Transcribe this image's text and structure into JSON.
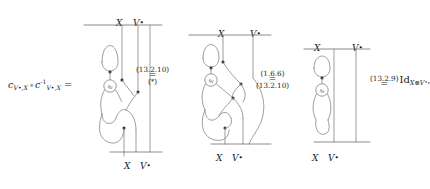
{
  "figure": {
    "kind": "string-diagram-equation",
    "lhs": {
      "c_symbol": "c",
      "sub1": "V•,X",
      "compose": "∘",
      "c_symbol2": "c",
      "inverse_exponent": "-1",
      "sub2": "V•,X",
      "equals": "="
    },
    "diagram1": {
      "name": "diagram-1",
      "top_labels": [
        "X",
        "V*"
      ],
      "bottom_labels": [
        "X",
        "V*"
      ],
      "node_label": "η",
      "node_sub": "V"
    },
    "diagram2": {
      "name": "diagram-2",
      "top_labels": [
        "X",
        "V*"
      ],
      "bottom_labels": [
        "X",
        "V*"
      ],
      "node_label": "η",
      "node_sub": "V"
    },
    "diagram3": {
      "name": "diagram-3",
      "top_labels": [
        "X",
        "V*"
      ],
      "bottom_labels": [
        "X",
        "V*"
      ],
      "node_label": "η",
      "node_sub": "V"
    },
    "ref1": {
      "label": "(13.2.10)",
      "equals": "=",
      "second": "(*)"
    },
    "ref2": {
      "label_top": "(1.6.6)",
      "equals": "=",
      "label_bottom": "(13.2.10)"
    },
    "ref3": {
      "label": "(13.2.9)",
      "equals": "=",
      "identity": "Id",
      "identity_sub": "X⊗V*",
      "trailing": ","
    },
    "colors": {
      "wire": "#8c8c8c",
      "rail": "#6e6e6e",
      "dot": "#202020",
      "text": "#1a1a1a",
      "background": "#ffffff"
    }
  }
}
